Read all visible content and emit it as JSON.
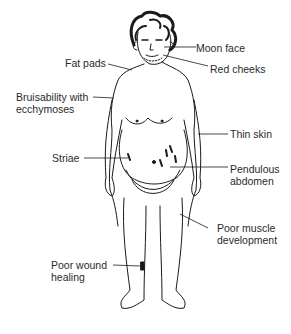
{
  "diagram": {
    "labels": {
      "moon_face": "Moon face",
      "fat_pads": "Fat pads",
      "red_cheeks": "Red cheeks",
      "bruisability_line1": "Bruisability with",
      "bruisability_line2": "ecchymoses",
      "thin_skin": "Thin skin",
      "striae": "Striae",
      "pendulous_line1": "Pendulous",
      "pendulous_line2": "abdomen",
      "poor_muscle_line1": "Poor muscle",
      "poor_muscle_line2": "development",
      "poor_wound_line1": "Poor wound",
      "poor_wound_line2": "healing"
    },
    "colors": {
      "line": "#1a1a1a",
      "text": "#2a2a2a",
      "background": "#ffffff"
    }
  }
}
